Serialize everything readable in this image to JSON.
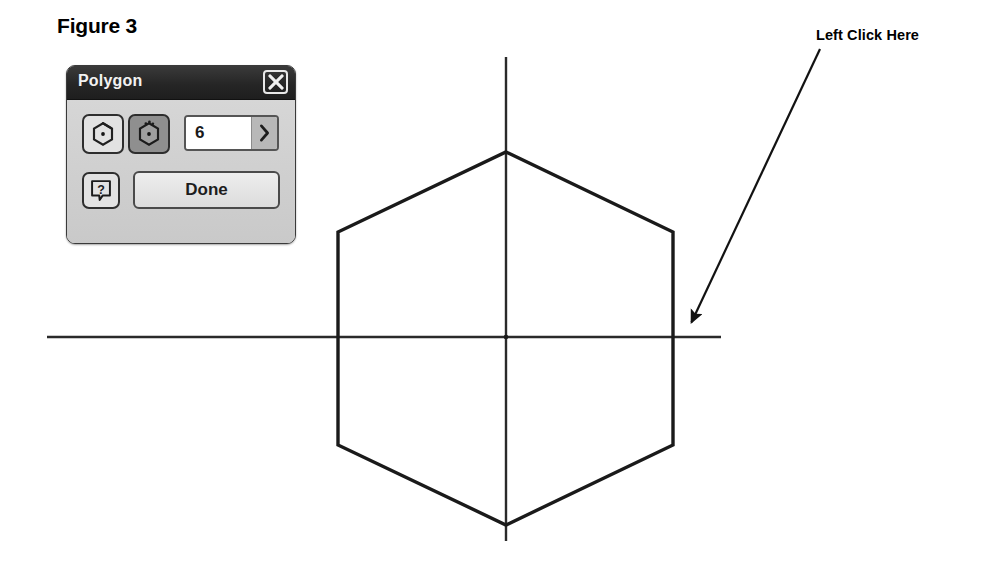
{
  "figure": {
    "caption": "Figure 3"
  },
  "annotation": {
    "label": "Left Click Here",
    "arrow_icon": "arrow-down-left-icon"
  },
  "dialog": {
    "title": "Polygon",
    "close_icon": "close-x-icon",
    "tools": {
      "inscribed_icon": "hexagon-inscribed-icon",
      "inscribed_label": "Inscribed polygon",
      "circumscribed_icon": "hexagon-circumscribed-icon",
      "circumscribed_label": "Circumscribed polygon",
      "circumscribed_selected": true
    },
    "sides_field": {
      "value": "6",
      "placeholder": "6",
      "stepper_icon": "chevron-right-icon"
    },
    "help": {
      "icon": "question-help-icon",
      "label": "Help"
    },
    "done_button": {
      "label": "Done"
    },
    "colors": {
      "titlebar": "#2b2b2b",
      "body": "#cdcdcd",
      "selected_tool": "#8f8f8f",
      "stroke": "#2e2e2e"
    }
  },
  "drawing": {
    "stroke_color": "#1a1a1a",
    "centerline_color": "#2a2a2a",
    "shape": "hexagon",
    "sides": 6,
    "center": {
      "x": 506,
      "y": 338
    },
    "vertices": [
      {
        "x": 506,
        "y": 152
      },
      {
        "x": 673,
        "y": 232
      },
      {
        "x": 673,
        "y": 445
      },
      {
        "x": 506,
        "y": 525
      },
      {
        "x": 338,
        "y": 445
      },
      {
        "x": 338,
        "y": 232
      }
    ],
    "horizontal_axis": {
      "x1": 47,
      "y1": 337,
      "x2": 721,
      "y2": 337
    },
    "vertical_axis": {
      "x1": 506,
      "y1": 57,
      "x2": 506,
      "y2": 541
    },
    "arrow": {
      "start": {
        "x": 820,
        "y": 49
      },
      "end": {
        "x": 686,
        "y": 334
      }
    }
  }
}
